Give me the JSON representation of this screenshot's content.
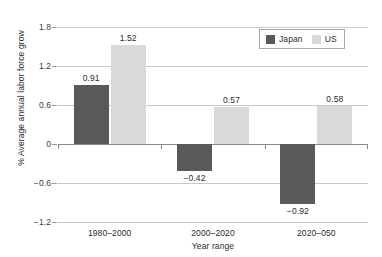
{
  "chart_data": {
    "type": "bar",
    "title": "",
    "xlabel": "Year range",
    "ylabel": "% Average annual labor force grow",
    "categories": [
      "1980–2000",
      "2000–2020",
      "2020–050"
    ],
    "series": [
      {
        "name": "Japan",
        "color": "#595959",
        "values": [
          0.91,
          -0.42,
          -0.92
        ],
        "labels": [
          "0.91",
          "−0.42",
          "−0.92"
        ]
      },
      {
        "name": "US",
        "color": "#d9d9d9",
        "values": [
          1.52,
          0.57,
          0.58
        ],
        "labels": [
          "1.52",
          "0.57",
          "0.58"
        ]
      }
    ],
    "ylim": [
      -1.2,
      1.8
    ],
    "yticks": [
      1.8,
      1.2,
      0.6,
      0,
      -0.6,
      -1.2
    ],
    "ytick_labels": [
      "1.8",
      "1.2",
      "0.6",
      "0",
      "−0.6",
      "−1.2"
    ],
    "grid": true,
    "legend_position": "top-right"
  },
  "legend": {
    "entries": [
      {
        "label": "Japan"
      },
      {
        "label": "US"
      }
    ]
  },
  "axes": {
    "x_title": "Year range",
    "y_title": "% Average annual labor force grow"
  }
}
